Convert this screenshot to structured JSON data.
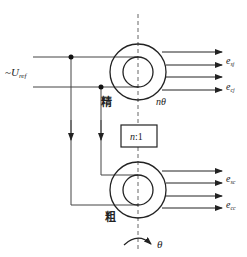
{
  "diagram": {
    "title": "",
    "input": {
      "label_prefix": "~",
      "label_main": "U",
      "label_sub": "ref"
    },
    "fine_channel": {
      "label": "精",
      "speed_label": "nθ"
    },
    "coarse_channel": {
      "label": "粗"
    },
    "gear_box": {
      "label": "n:1",
      "label_n": "n",
      "label_ratio": ":1"
    },
    "rotation": {
      "label": "θ"
    },
    "outputs_fine": [
      {
        "main": "e",
        "sub": "sj"
      },
      {
        "main": "e",
        "sub": "cj"
      }
    ],
    "outputs_coarse": [
      {
        "main": "e",
        "sub": "sc"
      },
      {
        "main": "e",
        "sub": "cc"
      }
    ],
    "colors": {
      "line": "#222222",
      "dash": "#666666",
      "wire": "#444444"
    }
  }
}
